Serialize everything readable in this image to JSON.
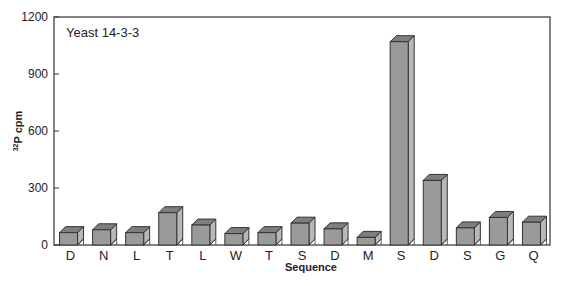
{
  "chart_data": {
    "type": "bar",
    "title": "Yeast 14-3-3",
    "xlabel": "Sequence",
    "ylabel_sup": "32",
    "ylabel_main": "P cpm",
    "ylim": [
      0,
      1200
    ],
    "yticks": [
      0,
      300,
      600,
      900,
      1200
    ],
    "grid": false,
    "categories": [
      "D",
      "N",
      "L",
      "T",
      "L",
      "W",
      "T",
      "S",
      "D",
      "M",
      "S",
      "D",
      "S",
      "G",
      "Q"
    ],
    "values": [
      65,
      80,
      65,
      170,
      105,
      60,
      65,
      115,
      85,
      40,
      1070,
      340,
      90,
      145,
      120
    ],
    "bar_style": "3d",
    "colors": {
      "bar_front": "#9a9a9a",
      "bar_top": "#7e7e7e",
      "bar_side": "#b8b8b8",
      "edge": "#333333"
    }
  }
}
